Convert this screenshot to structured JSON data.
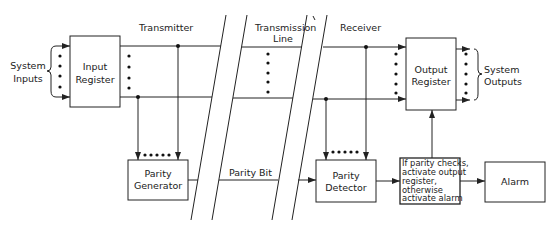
{
  "diagram": {
    "sections": {
      "transmitter": "Transmitter",
      "transmission_line_1": "Transmission",
      "transmission_line_2": "Line",
      "receiver": "Receiver"
    },
    "system_inputs": {
      "line1": "System",
      "line2": "Inputs"
    },
    "system_outputs": {
      "line1": "System",
      "line2": "Outputs"
    },
    "blocks": {
      "input_register": {
        "line1": "Input",
        "line2": "Register"
      },
      "output_register": {
        "line1": "Output",
        "line2": "Register"
      },
      "parity_generator": {
        "line1": "Parity",
        "line2": "Generator"
      },
      "parity_detector": {
        "line1": "Parity",
        "line2": "Detector"
      },
      "decision": {
        "line1": "If parity checks,",
        "line2": "activate output",
        "line3": "register,",
        "line4": "otherwise",
        "line5": "activate alarm"
      },
      "alarm": {
        "label": "Alarm"
      }
    },
    "signals": {
      "parity_bit": "Parity Bit"
    },
    "colors": {
      "line": "#222222",
      "background": "#ffffff"
    }
  }
}
